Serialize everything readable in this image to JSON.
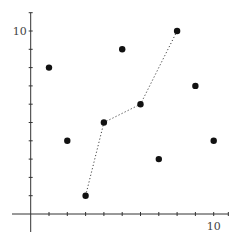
{
  "chart_data": {
    "type": "scatter",
    "title": "",
    "xlabel": "",
    "ylabel": "",
    "xlim": [
      -1,
      11
    ],
    "ylim": [
      -1,
      11
    ],
    "grid": false,
    "legend": null,
    "x_tick_labels": [
      {
        "value": 10,
        "label": "10"
      }
    ],
    "y_tick_labels": [
      {
        "value": 10,
        "label": "10"
      }
    ],
    "x_ticks": [
      1,
      2,
      3,
      4,
      5,
      6,
      7,
      8,
      9,
      10,
      11
    ],
    "y_ticks": [
      1,
      2,
      3,
      4,
      5,
      6,
      7,
      8,
      9,
      10,
      11
    ],
    "series": [
      {
        "name": "points",
        "type": "scatter",
        "points": [
          {
            "x": 1,
            "y": 8
          },
          {
            "x": 2,
            "y": 4
          },
          {
            "x": 3,
            "y": 1
          },
          {
            "x": 4,
            "y": 5
          },
          {
            "x": 5,
            "y": 9
          },
          {
            "x": 6,
            "y": 6
          },
          {
            "x": 7,
            "y": 3
          },
          {
            "x": 8,
            "y": 10
          },
          {
            "x": 9,
            "y": 7
          },
          {
            "x": 10,
            "y": 4
          }
        ]
      },
      {
        "name": "path",
        "type": "line",
        "style": "dotted",
        "points": [
          {
            "x": 3,
            "y": 1
          },
          {
            "x": 4,
            "y": 5
          },
          {
            "x": 6,
            "y": 6
          },
          {
            "x": 8,
            "y": 10
          }
        ]
      }
    ]
  }
}
